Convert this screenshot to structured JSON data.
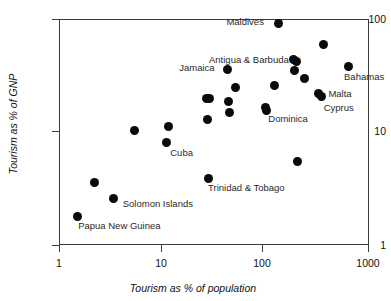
{
  "chart_data": {
    "type": "scatter",
    "title": "",
    "xlabel": "Tourism as % of population",
    "ylabel": "Tourism as % of GNP",
    "xscale": "log",
    "yscale": "log",
    "xlim": [
      1,
      1000
    ],
    "ylim": [
      1,
      100
    ],
    "xticks": [
      "1",
      "10",
      "100",
      "1000"
    ],
    "yticks": [
      "1",
      "10",
      "100"
    ],
    "grid": false,
    "legend": "none",
    "points": [
      {
        "label": "Papua New Guinea",
        "x": 1.5,
        "y": 1.8
      },
      {
        "label": "",
        "x": 2.2,
        "y": 3.6
      },
      {
        "label": "Solomon Islands",
        "x": 3.4,
        "y": 2.6
      },
      {
        "label": "",
        "x": 5.4,
        "y": 10.4
      },
      {
        "label": "Cuba",
        "x": 11.0,
        "y": 8.0
      },
      {
        "label": "",
        "x": 11.5,
        "y": 11.2
      },
      {
        "label": "",
        "x": 27.0,
        "y": 19.8
      },
      {
        "label": "",
        "x": 29.0,
        "y": 19.8
      },
      {
        "label": "",
        "x": 27.5,
        "y": 12.8
      },
      {
        "label": "Trinidad & Tobago",
        "x": 28.0,
        "y": 3.9
      },
      {
        "label": "Jamaica",
        "x": 43.0,
        "y": 36.0
      },
      {
        "label": "",
        "x": 44.0,
        "y": 18.8
      },
      {
        "label": "",
        "x": 45.0,
        "y": 14.8
      },
      {
        "label": "",
        "x": 52.0,
        "y": 25.0
      },
      {
        "label": "",
        "x": 100.0,
        "y": 16.5
      },
      {
        "label": "Dominica",
        "x": 103.0,
        "y": 15.5
      },
      {
        "label": "",
        "x": 125.0,
        "y": 26.0
      },
      {
        "label": "Maldives",
        "x": 135.0,
        "y": 92.0
      },
      {
        "label": "",
        "x": 190.0,
        "y": 44.0
      },
      {
        "label": "Antigua & Barbuda",
        "x": 200.0,
        "y": 42.0
      },
      {
        "label": "",
        "x": 195.0,
        "y": 35.0
      },
      {
        "label": "",
        "x": 205.0,
        "y": 5.5
      },
      {
        "label": "",
        "x": 240.0,
        "y": 30.0
      },
      {
        "label": "Malta",
        "x": 330.0,
        "y": 22.0
      },
      {
        "label": "Cyprus",
        "x": 355.0,
        "y": 20.5
      },
      {
        "label": "",
        "x": 370.0,
        "y": 60.0
      },
      {
        "label": "Bahamas",
        "x": 640.0,
        "y": 38.0
      }
    ]
  },
  "axes": {
    "x_title": "Tourism as % of population",
    "y_title": "Tourism as % of GNP",
    "x_tick_labels": [
      "1",
      "10",
      "100",
      "1000"
    ],
    "y_tick_labels": [
      "100",
      "10",
      "1"
    ]
  },
  "annotations": [
    {
      "name": "maldives",
      "text": "Maldives"
    },
    {
      "name": "antigua-barbuda",
      "text": "Antigua & Barbuda"
    },
    {
      "name": "jamaica",
      "text": "Jamaica"
    },
    {
      "name": "bahamas",
      "text": "Bahamas"
    },
    {
      "name": "malta",
      "text": "Malta"
    },
    {
      "name": "cyprus",
      "text": "Cyprus"
    },
    {
      "name": "dominica",
      "text": "Dominica"
    },
    {
      "name": "cuba",
      "text": "Cuba"
    },
    {
      "name": "trinidad-tobago",
      "text": "Trinidad & Tobago"
    },
    {
      "name": "solomon-islands",
      "text": "Solomon Islands"
    },
    {
      "name": "papua-new-guinea",
      "text": "Papua New Guinea"
    }
  ],
  "colors": {
    "marker": "#0a0a0a",
    "axis": "#3b3b3b",
    "label": "#2a2a2a",
    "background": "#ffffff"
  }
}
